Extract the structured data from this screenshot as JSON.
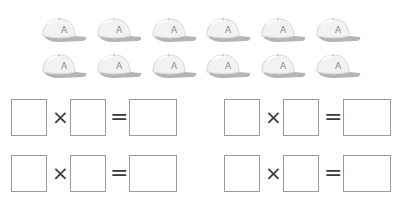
{
  "caps": {
    "rows": 2,
    "per_row": 6,
    "letter": "A",
    "icon": "baseball-cap-icon",
    "colors": {
      "crown": "#f2f2f2",
      "outline": "#cfcfcf",
      "brim": "#b5b5b5",
      "letter": "#8a8a8a"
    }
  },
  "equations": [
    {
      "a": "",
      "op": "×",
      "b": "",
      "eq": "=",
      "result": ""
    },
    {
      "a": "",
      "op": "×",
      "b": "",
      "eq": "=",
      "result": ""
    },
    {
      "a": "",
      "op": "×",
      "b": "",
      "eq": "=",
      "result": ""
    },
    {
      "a": "",
      "op": "×",
      "b": "",
      "eq": "=",
      "result": ""
    }
  ]
}
